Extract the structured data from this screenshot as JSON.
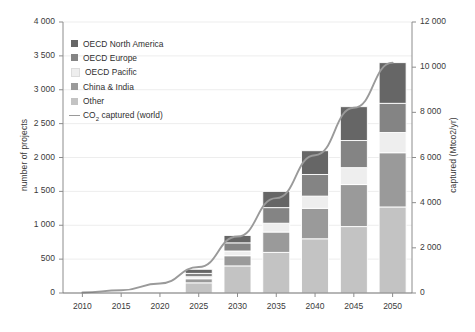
{
  "chart_data": {
    "type": "bar",
    "title": "",
    "subtitle": "",
    "categories": [
      "2010",
      "2015",
      "2020",
      "2025",
      "2030",
      "2035",
      "2040",
      "2045",
      "2050"
    ],
    "xlabel": "",
    "ylabel": "number of projects",
    "ylabel_right": "captured (Mtco2/yr)",
    "ylim": [
      0,
      4000
    ],
    "ylim_right": [
      0,
      12000
    ],
    "yticks": [
      0,
      500,
      1000,
      1500,
      2000,
      2500,
      3000,
      3500,
      4000
    ],
    "ytick_labels": [
      "0",
      "500",
      "1 000",
      "1 500",
      "2 000",
      "2 500",
      "3 000",
      "3 500",
      "4 000"
    ],
    "yticks_right": [
      0,
      2000,
      4000,
      6000,
      8000,
      10000,
      12000
    ],
    "ytick_labels_right": [
      "0",
      "2 000",
      "4 000",
      "6 000",
      "8 000",
      "10 000",
      "12 000"
    ],
    "grid": true,
    "grid_axis": "y",
    "legend_position": "upper-left",
    "stacked": true,
    "series": [
      {
        "name": "Other",
        "color": "#c3c3c3",
        "values": [
          0,
          0,
          0,
          150,
          400,
          600,
          800,
          980,
          1270
        ]
      },
      {
        "name": "China & India",
        "color": "#9a9a9a",
        "values": [
          0,
          0,
          0,
          60,
          150,
          300,
          450,
          620,
          800
        ]
      },
      {
        "name": "OECD Pacific",
        "color": "#eeeeee",
        "values": [
          0,
          0,
          0,
          30,
          70,
          130,
          180,
          250,
          300
        ]
      },
      {
        "name": "OECD Europe",
        "color": "#848484",
        "values": [
          0,
          0,
          0,
          50,
          120,
          230,
          320,
          400,
          430
        ]
      },
      {
        "name": "OECD North America",
        "color": "#666666",
        "values": [
          0,
          0,
          0,
          60,
          110,
          240,
          350,
          500,
          600
        ]
      }
    ],
    "totals": [
      0,
      0,
      0,
      350,
      850,
      1500,
      2100,
      2750,
      3400
    ],
    "line_series": {
      "name": "CO₂ captured (world)",
      "color": "#9a9a9a",
      "axis": "right",
      "x": [
        "2010",
        "2015",
        "2020",
        "2025",
        "2030",
        "2035",
        "2040",
        "2045",
        "2050"
      ],
      "values": [
        20,
        120,
        420,
        1150,
        2500,
        4200,
        6100,
        8200,
        10200
      ]
    }
  },
  "axes": {
    "left_title": "number of projects",
    "right_title": "captured (Mtco2/yr)"
  },
  "legend": {
    "items": [
      {
        "label": "OECD North America",
        "type": "swatch",
        "color": "#666666"
      },
      {
        "label": "OECD Europe",
        "type": "swatch",
        "color": "#848484"
      },
      {
        "label": "OECD Pacific",
        "type": "swatch",
        "color": "#eeeeee"
      },
      {
        "label": "China & India",
        "type": "swatch",
        "color": "#9a9a9a"
      },
      {
        "label": "Other",
        "type": "swatch",
        "color": "#c3c3c3"
      },
      {
        "label": "CO2 captured (world)",
        "type": "line",
        "color": "#9a9a9a"
      }
    ]
  }
}
